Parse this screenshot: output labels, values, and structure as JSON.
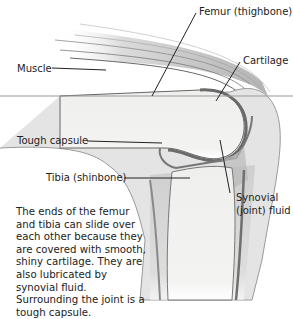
{
  "diagram": {
    "labels": {
      "femur": "Femur (thighbone)",
      "cartilage": "Cartilage",
      "muscle": "Muscle",
      "tough_capsule": "Tough capsule",
      "tibia": "Tibia (shinbone)",
      "synovial_line1": "Synovial",
      "synovial_line2": "(joint) fluid"
    },
    "description": "The ends of the femur and tibia can slide over each other because they are covered with smooth, shiny cartilage. They are also lubricated by synovial fluid. Surrounding the joint is a tough capsule.",
    "colors": {
      "bone": "#f1f1f0",
      "outline": "#555555",
      "tissue": "#c8c8c8",
      "cartilage_dark": "#6a6a6a",
      "leader": "#222222"
    }
  }
}
